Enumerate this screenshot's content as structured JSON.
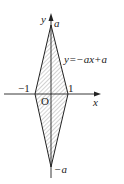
{
  "diagram": {
    "axes": {
      "x_label": "x",
      "y_label": "y",
      "origin_label": "O"
    },
    "ticks": {
      "neg_one": "−1",
      "one": "1"
    },
    "points": {
      "top": "a",
      "bottom": "−a"
    },
    "equation": "y=−ax+a",
    "region": {
      "shape": "rhombus",
      "fill": "hatched",
      "vertices": [
        [
          0,
          "a"
        ],
        [
          1,
          0
        ],
        [
          0,
          "-a"
        ],
        [
          -1,
          0
        ]
      ]
    },
    "colors": {
      "line": "#222222",
      "hatch": "#555555",
      "background": "#ffffff"
    }
  }
}
